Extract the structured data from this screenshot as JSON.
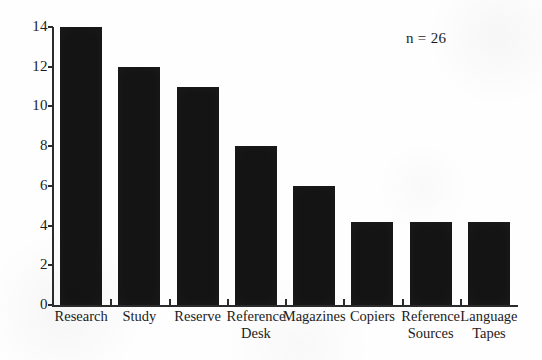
{
  "chart_data": {
    "type": "bar",
    "title": "",
    "subtitle": "",
    "xlabel": "",
    "ylabel": "",
    "categories": [
      "Research",
      "Study",
      "Reserve",
      "Reference Desk",
      "Magazines",
      "Copiers",
      "Reference Sources",
      "Language Tapes"
    ],
    "category_lines": [
      [
        "Research",
        ""
      ],
      [
        "Study",
        ""
      ],
      [
        "Reserve",
        ""
      ],
      [
        "Reference",
        "Desk"
      ],
      [
        "Magazines",
        ""
      ],
      [
        "Copiers",
        ""
      ],
      [
        "Reference",
        "Sources"
      ],
      [
        "Language",
        "Tapes"
      ]
    ],
    "values": [
      14,
      12,
      11,
      8,
      6,
      4.2,
      4.2,
      4.2
    ],
    "ylim": [
      0,
      14
    ],
    "ytick_labels": [
      "14",
      "12",
      "10",
      "8",
      "6",
      "4",
      "2",
      "0"
    ],
    "ytick_values": [
      14,
      12,
      10,
      8,
      6,
      4,
      2,
      0
    ],
    "grid": false,
    "legend": null,
    "legend_position": "none",
    "annotations": [
      {
        "text": "n = 26",
        "position": "top-right"
      }
    ],
    "bar_color": "#141414",
    "axis_color": "#2b2b2b",
    "background_color": "#fefefe"
  },
  "annotation": {
    "sample_size": "n = 26"
  },
  "axis": {
    "y_ticks": [
      {
        "label": "14",
        "value": 14
      },
      {
        "label": "12",
        "value": 12
      },
      {
        "label": "10",
        "value": 10
      },
      {
        "label": "8",
        "value": 8
      },
      {
        "label": "6",
        "value": 6
      },
      {
        "label": "4",
        "value": 4
      },
      {
        "label": "2",
        "value": 2
      },
      {
        "label": "0",
        "value": 0
      }
    ]
  }
}
